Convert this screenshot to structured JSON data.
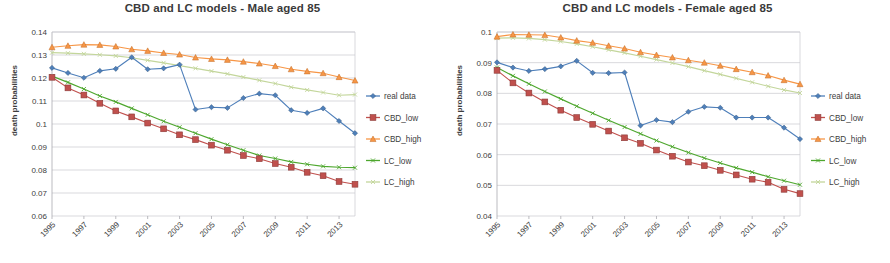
{
  "page": {
    "background": "#ffffff",
    "width": 890,
    "height": 263
  },
  "palette": {
    "real_data": "#4e7fba",
    "cbd_low": "#c0504d",
    "cbd_high": "#f79646",
    "lc_low": "#4ea72e",
    "lc_high": "#c3d69b",
    "grid": "#c8c8cf",
    "text": "#3d3d3d",
    "title": "#3a3a3a"
  },
  "legend": {
    "position": "right",
    "entries": [
      {
        "label": "real data",
        "color": "#4e7fba",
        "marker": "diamond"
      },
      {
        "label": "CBD_low",
        "color": "#c0504d",
        "marker": "square"
      },
      {
        "label": "CBD_high",
        "color": "#f79646",
        "marker": "triangle"
      },
      {
        "label": "LC_low",
        "color": "#4ea72e",
        "marker": "x"
      },
      {
        "label": "LC_high",
        "color": "#c3d69b",
        "marker": "x"
      }
    ]
  },
  "chart_data": [
    {
      "type": "line",
      "id": "male",
      "title": "CBD and LC models - Male aged 85",
      "xlabel": "",
      "ylabel": "death probabilities",
      "grid": true,
      "legend_position": "right",
      "x": [
        1995,
        1996,
        1997,
        1998,
        1999,
        2000,
        2001,
        2002,
        2003,
        2004,
        2005,
        2006,
        2007,
        2008,
        2009,
        2010,
        2011,
        2012,
        2013,
        2014
      ],
      "xtick_labels": [
        "1995",
        "1997",
        "1999",
        "2001",
        "2003",
        "2005",
        "2007",
        "2009",
        "2011",
        "2013"
      ],
      "xtick_values": [
        1995,
        1997,
        1999,
        2001,
        2003,
        2005,
        2007,
        2009,
        2011,
        2013
      ],
      "ylim": [
        0.06,
        0.14
      ],
      "ytick_values": [
        0.06,
        0.07,
        0.08,
        0.09,
        0.1,
        0.11,
        0.12,
        0.13,
        0.14
      ],
      "ytick_labels": [
        "0.06",
        "0.07",
        "0.08",
        "0.09",
        "0.1",
        "0.11",
        "0.12",
        "0.13",
        "0.14"
      ],
      "series": [
        {
          "name": "real data",
          "color": "#4e7fba",
          "marker": "diamond",
          "values": [
            0.1244,
            0.1222,
            0.1201,
            0.1231,
            0.124,
            0.129,
            0.1238,
            0.1242,
            0.1258,
            0.1063,
            0.1073,
            0.107,
            0.1113,
            0.1132,
            0.1125,
            0.106,
            0.1048,
            0.1068,
            0.1013,
            0.096
          ]
        },
        {
          "name": "CBD_low",
          "color": "#c0504d",
          "marker": "square",
          "values": [
            0.1203,
            0.1157,
            0.1126,
            0.109,
            0.1057,
            0.1031,
            0.1004,
            0.0979,
            0.0953,
            0.0932,
            0.0908,
            0.0886,
            0.0863,
            0.0849,
            0.0828,
            0.0812,
            0.079,
            0.0775,
            0.075,
            0.0738
          ]
        },
        {
          "name": "CBD_high",
          "color": "#f79646",
          "marker": "triangle",
          "values": [
            0.1334,
            0.134,
            0.1345,
            0.1344,
            0.1337,
            0.1325,
            0.1318,
            0.1309,
            0.1302,
            0.1289,
            0.1283,
            0.1279,
            0.1271,
            0.1263,
            0.1252,
            0.1238,
            0.1229,
            0.1221,
            0.1204,
            0.1189
          ]
        },
        {
          "name": "LC_low",
          "color": "#4ea72e",
          "marker": "x",
          "values": [
            0.1208,
            0.1181,
            0.1152,
            0.1122,
            0.1096,
            0.1068,
            0.104,
            0.1012,
            0.0986,
            0.096,
            0.0934,
            0.091,
            0.0886,
            0.0863,
            0.085,
            0.0835,
            0.0825,
            0.0816,
            0.0812,
            0.081
          ]
        },
        {
          "name": "LC_high",
          "color": "#c3d69b",
          "marker": "x",
          "values": [
            0.131,
            0.1308,
            0.1305,
            0.1301,
            0.1296,
            0.1288,
            0.1277,
            0.1266,
            0.1254,
            0.1242,
            0.123,
            0.1218,
            0.1204,
            0.119,
            0.1176,
            0.116,
            0.1148,
            0.1137,
            0.1125,
            0.1128
          ]
        }
      ]
    },
    {
      "type": "line",
      "id": "female",
      "title": "CBD and LC models - Female aged 85",
      "xlabel": "",
      "ylabel": "death probabilities",
      "grid": true,
      "legend_position": "right",
      "x": [
        1995,
        1996,
        1997,
        1998,
        1999,
        2000,
        2001,
        2002,
        2003,
        2004,
        2005,
        2006,
        2007,
        2008,
        2009,
        2010,
        2011,
        2012,
        2013,
        2014
      ],
      "xtick_labels": [
        "1995",
        "1997",
        "1999",
        "2001",
        "2003",
        "2005",
        "2007",
        "2009",
        "2011",
        "2013"
      ],
      "xtick_values": [
        1995,
        1997,
        1999,
        2001,
        2003,
        2005,
        2007,
        2009,
        2011,
        2013
      ],
      "ylim": [
        0.04,
        0.1
      ],
      "ytick_values": [
        0.04,
        0.05,
        0.06,
        0.07,
        0.08,
        0.09,
        0.1
      ],
      "ytick_labels": [
        "0.04",
        "0.05",
        "0.06",
        "0.07",
        "0.08",
        "0.09",
        "0.1"
      ],
      "series": [
        {
          "name": "real data",
          "color": "#4e7fba",
          "marker": "diamond",
          "values": [
            0.0901,
            0.0884,
            0.0873,
            0.0879,
            0.0888,
            0.0906,
            0.0867,
            0.0866,
            0.0868,
            0.0695,
            0.0713,
            0.0706,
            0.074,
            0.0756,
            0.0753,
            0.0721,
            0.0721,
            0.0721,
            0.0688,
            0.0651
          ]
        },
        {
          "name": "CBD_low",
          "color": "#c0504d",
          "marker": "square",
          "values": [
            0.0875,
            0.0834,
            0.0801,
            0.0772,
            0.0745,
            0.0721,
            0.0699,
            0.0677,
            0.0655,
            0.0637,
            0.0615,
            0.0595,
            0.0576,
            0.0564,
            0.0549,
            0.0534,
            0.052,
            0.051,
            0.0487,
            0.0473
          ]
        },
        {
          "name": "CBD_high",
          "color": "#f79646",
          "marker": "triangle",
          "values": [
            0.0985,
            0.0992,
            0.0991,
            0.099,
            0.0982,
            0.0972,
            0.0965,
            0.0955,
            0.0946,
            0.0934,
            0.0925,
            0.0917,
            0.0908,
            0.09,
            0.089,
            0.0879,
            0.0869,
            0.0858,
            0.0843,
            0.083
          ]
        },
        {
          "name": "LC_low",
          "color": "#4ea72e",
          "marker": "x",
          "values": [
            0.0884,
            0.0857,
            0.0831,
            0.0806,
            0.0782,
            0.0758,
            0.0735,
            0.0712,
            0.069,
            0.0668,
            0.0646,
            0.0626,
            0.0607,
            0.0589,
            0.0573,
            0.0557,
            0.0543,
            0.0528,
            0.0515,
            0.0502
          ]
        },
        {
          "name": "LC_high",
          "color": "#c3d69b",
          "marker": "x",
          "values": [
            0.098,
            0.0981,
            0.0979,
            0.0975,
            0.0969,
            0.0961,
            0.0952,
            0.0942,
            0.0932,
            0.0921,
            0.091,
            0.0899,
            0.0887,
            0.0874,
            0.0862,
            0.0849,
            0.0836,
            0.0823,
            0.0811,
            0.0801
          ]
        }
      ]
    }
  ]
}
